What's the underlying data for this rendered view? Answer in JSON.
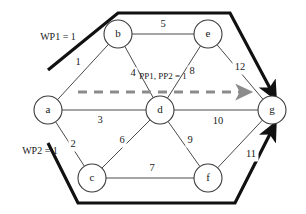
{
  "diagram": {
    "type": "weighted-undirected-graph-with-paths",
    "nodes": [
      {
        "id": "a",
        "label": "a",
        "cx": 48,
        "cy": 110
      },
      {
        "id": "b",
        "label": "b",
        "cx": 118,
        "cy": 34
      },
      {
        "id": "c",
        "label": "c",
        "cx": 92,
        "cy": 178
      },
      {
        "id": "d",
        "label": "d",
        "cx": 160,
        "cy": 110
      },
      {
        "id": "e",
        "label": "e",
        "cx": 208,
        "cy": 34
      },
      {
        "id": "f",
        "label": "f",
        "cx": 208,
        "cy": 178
      },
      {
        "id": "g",
        "label": "g",
        "cx": 272,
        "cy": 110
      }
    ],
    "node_radius": 14,
    "edges": [
      {
        "from": "a",
        "to": "b",
        "weight": "1",
        "lx": 78,
        "ly": 63
      },
      {
        "from": "a",
        "to": "c",
        "weight": "2",
        "lx": 73,
        "ly": 145
      },
      {
        "from": "a",
        "to": "d",
        "weight": "3",
        "lx": 100,
        "ly": 121
      },
      {
        "from": "b",
        "to": "d",
        "weight": "4",
        "lx": 133,
        "ly": 74
      },
      {
        "from": "b",
        "to": "e",
        "weight": "5",
        "lx": 163,
        "ly": 25
      },
      {
        "from": "c",
        "to": "d",
        "weight": "6",
        "lx": 122,
        "ly": 141
      },
      {
        "from": "c",
        "to": "f",
        "weight": "7",
        "lx": 152,
        "ly": 169
      },
      {
        "from": "d",
        "to": "e",
        "weight": "8",
        "lx": 192,
        "ly": 72
      },
      {
        "from": "d",
        "to": "f",
        "weight": "9",
        "lx": 190,
        "ly": 141
      },
      {
        "from": "d",
        "to": "g",
        "weight": "10",
        "lx": 218,
        "ly": 122
      },
      {
        "from": "f",
        "to": "g",
        "weight": "11",
        "lx": 251,
        "ly": 155
      },
      {
        "from": "e",
        "to": "g",
        "weight": "12",
        "lx": 240,
        "ly": 68
      }
    ],
    "working_paths": [
      {
        "id": "WP1",
        "label": "WP1 = 1",
        "label_x": 58,
        "label_y": 38,
        "points": "48,70 118,13 230,13 272,92",
        "arrow_at": "g"
      },
      {
        "id": "WP2",
        "label": "WP2 = 1",
        "label_x": 40,
        "label_y": 152,
        "points": "48,143 78,203 235,203 272,130",
        "arrow_at": "g"
      }
    ],
    "protection_path": {
      "id": "PP1-PP2",
      "label": "PP1, PP2 = 1",
      "label_x": 163,
      "label_y": 77,
      "start_x": 78,
      "start_y": 92,
      "end_x": 243,
      "end_y": 92,
      "style": "dashed",
      "color": "#8c8c8c"
    },
    "colors": {
      "node_stroke": "#3a3a3a",
      "edge_stroke": "#4a4a4a",
      "working_path": "#111111",
      "protection_path": "#8c8c8c",
      "background": "#ffffff",
      "text": "#1a1a1a"
    }
  }
}
